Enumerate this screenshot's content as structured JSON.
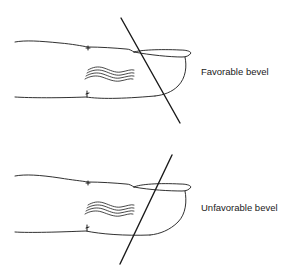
{
  "figure": {
    "panels": [
      {
        "id": "favorable",
        "label": "Favorable bevel",
        "line_direction": "descending toward fingertip (top-left to bottom-right)"
      },
      {
        "id": "unfavorable",
        "label": "Unfavorable bevel",
        "line_direction": "ascending toward fingertip (bottom-left to top-right)"
      }
    ],
    "colors": {
      "stroke": "#1a1a1a",
      "background": "#ffffff"
    }
  }
}
